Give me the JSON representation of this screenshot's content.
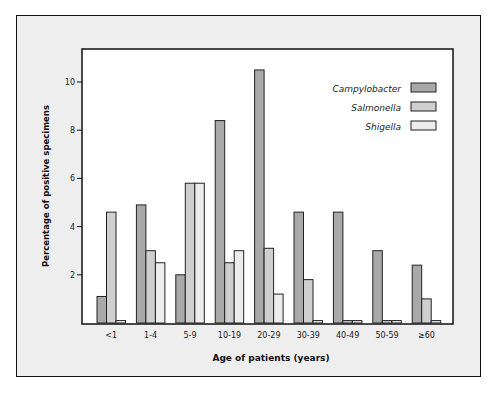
{
  "chart_data": {
    "type": "bar",
    "title": "",
    "xlabel": "Age of patients (years)",
    "ylabel": "Percentage of positive specimens",
    "ylim": [
      0,
      11
    ],
    "yticks": [
      2,
      4,
      6,
      8,
      10
    ],
    "grid": false,
    "legend_position": "upper right",
    "categories": [
      "<1",
      "1-4",
      "5-9",
      "10-19",
      "20-29",
      "30-39",
      "40-49",
      "50-59",
      "≥60"
    ],
    "series": [
      {
        "name": "Campylobacter",
        "color": "#a9a9a9",
        "values": [
          1.1,
          4.9,
          2.0,
          8.4,
          10.5,
          4.6,
          4.6,
          3.0,
          2.4
        ]
      },
      {
        "name": "Salmonella",
        "color": "#cfcfcf",
        "values": [
          4.6,
          3.0,
          5.8,
          2.5,
          3.1,
          1.8,
          0.1,
          0.1,
          1.0
        ]
      },
      {
        "name": "Shigella",
        "color": "#ececec",
        "values": [
          0.1,
          2.5,
          5.8,
          3.0,
          1.2,
          0.1,
          0.1,
          0.1,
          0.1
        ]
      }
    ]
  }
}
